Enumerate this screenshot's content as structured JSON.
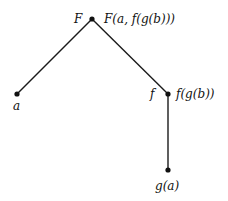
{
  "tree": {
    "nodes": [
      {
        "id": "root",
        "symbol": "F",
        "term": "F(a, f(g(b)))"
      },
      {
        "id": "a",
        "symbol": "a",
        "term": ""
      },
      {
        "id": "f",
        "symbol": "f",
        "term": "f(g(b))"
      },
      {
        "id": "g",
        "symbol": "",
        "term": "g(a)"
      }
    ],
    "edges": [
      {
        "from": "root",
        "to": "a"
      },
      {
        "from": "root",
        "to": "f"
      },
      {
        "from": "f",
        "to": "g"
      }
    ]
  }
}
